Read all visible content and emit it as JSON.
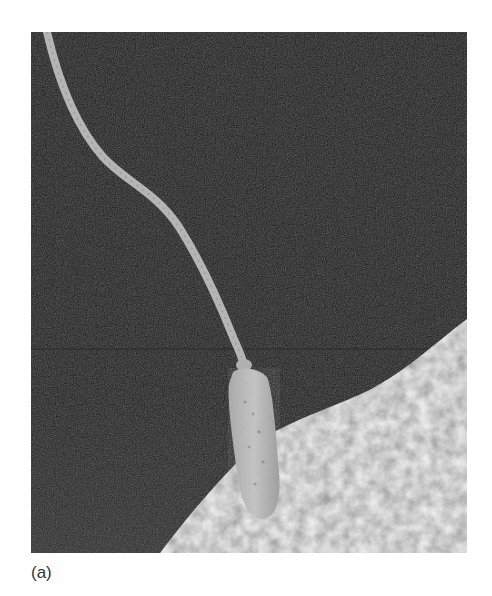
{
  "figure": {
    "colors": {
      "background": "#0e0e0e",
      "sperm": "#b9b9b9",
      "egg_surface": "#d4d4d4",
      "page": "#ffffff"
    }
  },
  "caption": {
    "label": "(a)"
  }
}
